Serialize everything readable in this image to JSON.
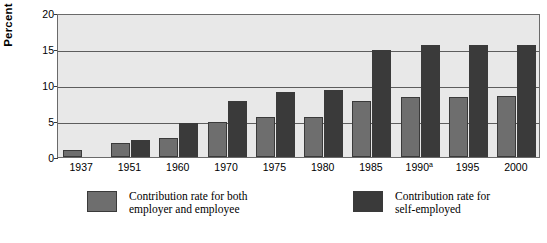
{
  "chart_data": {
    "type": "bar",
    "title": "",
    "xlabel": "",
    "ylabel": "Percent",
    "ylim": [
      0,
      20
    ],
    "yticks": [
      0,
      5,
      10,
      15,
      20
    ],
    "grid": true,
    "legend_position": "bottom",
    "categories": [
      "1937",
      "1951",
      "1960",
      "1970",
      "1975",
      "1980",
      "1985",
      "1990ᵃ",
      "1995",
      "2000"
    ],
    "category_notes": {
      "1990ᵃ": "a"
    },
    "series": [
      {
        "name": "Contribution rate for both\nemployer and employee",
        "short_name": "employer-and-employee",
        "color": "#6e6e6e",
        "values": [
          1.0,
          2.0,
          2.7,
          4.8,
          5.5,
          5.6,
          7.8,
          8.3,
          8.4,
          8.5
        ]
      },
      {
        "name": "Contribution rate for\nself-employed",
        "short_name": "self-employed",
        "color": "#3a3a3a",
        "values": [
          0.0,
          2.4,
          4.7,
          7.8,
          9.0,
          9.3,
          14.8,
          15.5,
          15.6,
          15.6
        ]
      }
    ]
  },
  "axes": {
    "y_tick_labels": [
      "0",
      "5",
      "10",
      "15",
      "20"
    ],
    "y_axis_title": "Percent"
  },
  "legend": {
    "entries": [
      {
        "label": "Contribution rate for both\nemployer and employee",
        "swatch": "light"
      },
      {
        "label": "Contribution rate for\nself-employed",
        "swatch": "dark"
      }
    ]
  },
  "colors": {
    "plot_background": "#e8e8e8",
    "gridline": "#5d5d5d",
    "series_light": "#6e6e6e",
    "series_dark": "#3a3a3a",
    "page_background": "#ffffff"
  }
}
